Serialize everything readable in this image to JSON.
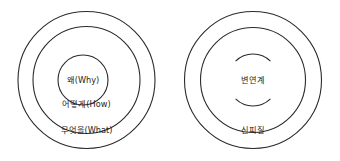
{
  "figure": {
    "type": "concentric-circle-diagram",
    "background_color": "#ffffff",
    "stroke_color": "#2b2b2b",
    "text_color": "#1d1d1d",
    "panel_count": 2
  },
  "left_diagram": {
    "name": "golden-circle",
    "ring_count": 3,
    "outer": {
      "label": "무엇을(What)"
    },
    "middle": {
      "label": "어떻게(How)"
    },
    "inner": {
      "label": "왜(Why)"
    }
  },
  "right_diagram": {
    "name": "brain-layers",
    "ring_count": 3,
    "outer": {
      "label": "신피질"
    },
    "middle": {
      "label": ""
    },
    "inner": {
      "label": "변연계"
    }
  }
}
